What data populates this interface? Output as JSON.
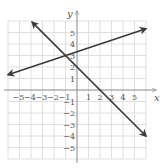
{
  "chart_data": {
    "type": "line",
    "title": "",
    "xlabel": "x",
    "ylabel": "y",
    "xlim": [
      -6,
      6
    ],
    "ylim": [
      -6,
      6
    ],
    "grid": true,
    "x_ticks": [
      -5,
      -4,
      -3,
      -2,
      -1,
      1,
      2,
      3,
      4,
      5
    ],
    "y_ticks": [
      5,
      4,
      3,
      2,
      1,
      -1,
      -2,
      -3,
      -4,
      -5
    ],
    "series": [
      {
        "name": "line-rising",
        "equation": "y = (1/3)x + 10/3",
        "slope": 0.3333,
        "intercept": 3.3333,
        "points": [
          [
            -6,
            1.33
          ],
          [
            6,
            5.33
          ]
        ],
        "arrows": "both"
      },
      {
        "name": "line-falling",
        "equation": "y = -x + 2",
        "slope": -1,
        "intercept": 2,
        "points": [
          [
            -3.9,
            5.9
          ],
          [
            6,
            -4
          ]
        ],
        "arrows": "both"
      }
    ],
    "intersection": [
      -1,
      3
    ],
    "colors": {
      "grid": "#d8d8d8",
      "axis": "#888888",
      "line": "#3a3a3a",
      "text": "#555555"
    }
  }
}
